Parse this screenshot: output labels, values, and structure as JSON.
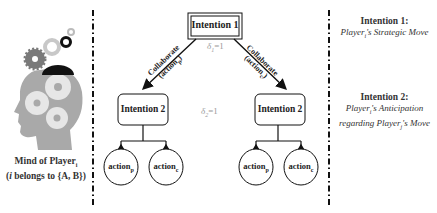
{
  "mind": {
    "caption_line1": "Mind of Player",
    "caption_line1_sub": "i",
    "caption_line2_prefix": "(",
    "caption_line2_var": "i",
    "caption_line2_rest": " belongs to {A, B})",
    "icon": "head-with-gears-icon"
  },
  "tree": {
    "root": {
      "label": "Intention 1"
    },
    "delta1": {
      "symbol": "δ",
      "sub": "1",
      "value": "=1"
    },
    "delta2": {
      "symbol": "δ",
      "sub": "2",
      "value": "=1"
    },
    "left_edge": {
      "line1": "Collaborate",
      "line2": "(action",
      "line2_sub": "p",
      "line2_end": ")"
    },
    "right_edge": {
      "line1": "Collaborate",
      "line2": "(action",
      "line2_sub": "c",
      "line2_end": ")"
    },
    "left_child": {
      "label": "Intention 2",
      "leaves": [
        {
          "label": "action",
          "sub": "p"
        },
        {
          "label": "action",
          "sub": "c"
        }
      ]
    },
    "right_child": {
      "label": "Intention 2",
      "leaves": [
        {
          "label": "action",
          "sub": "p"
        },
        {
          "label": "action",
          "sub": "c"
        }
      ]
    }
  },
  "legend": {
    "intention1": {
      "title": "Intention 1:",
      "line1_a": "Player",
      "line1_sub": "i",
      "line1_b": "'s Strategic Move"
    },
    "intention2": {
      "title": "Intention 2:",
      "line1_a": "Player",
      "line1_sub": "i",
      "line1_b": "'s Anticipation",
      "line2_a": "regarding Player",
      "line2_sub": "j",
      "line2_b": "'s Move"
    }
  },
  "colors": {
    "head": "#a9a9a9",
    "gear_light": "#d3d3d3",
    "gear_dark": "#7a7a7a",
    "gear_black": "#111111",
    "line": "#111111",
    "delta": "#999999"
  }
}
